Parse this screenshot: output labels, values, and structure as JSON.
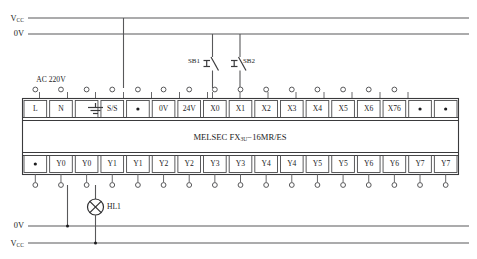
{
  "diagram": {
    "device_label": "MELSEC FX",
    "device_label_sub": "3U",
    "device_label_tail": "−16MR/ES",
    "colors": {
      "wire": "#58585a",
      "box": "#3a3a3c",
      "text": "#1c1c1e",
      "background": "#ffffff"
    }
  },
  "rails": {
    "top": [
      {
        "name": "vcc-top",
        "label": "V",
        "label_sub": "CC"
      },
      {
        "name": "zerov-top",
        "label": "0V",
        "label_sub": ""
      }
    ],
    "bottom": [
      {
        "name": "zerov-bottom",
        "label": "0V",
        "label_sub": ""
      },
      {
        "name": "vcc-bottom",
        "label": "V",
        "label_sub": "CC"
      }
    ]
  },
  "source": {
    "ac_label": "AC 220V"
  },
  "switches": [
    {
      "name": "sb1",
      "label": "SB1",
      "terminal": "X0"
    },
    {
      "name": "sb2",
      "label": "SB2",
      "terminal": "X1"
    }
  ],
  "lamp": {
    "name": "hl1",
    "label": "HL1"
  },
  "top_terminals": [
    {
      "label": "L",
      "icon": ""
    },
    {
      "label": "N",
      "icon": ""
    },
    {
      "label": "",
      "icon": "earth-ground-icon"
    },
    {
      "label": "S/S",
      "icon": ""
    },
    {
      "label": "",
      "icon": "dot-icon"
    },
    {
      "label": "0V",
      "icon": ""
    },
    {
      "label": "24V",
      "icon": ""
    },
    {
      "label": "X0",
      "icon": ""
    },
    {
      "label": "X1",
      "icon": ""
    },
    {
      "label": "X2",
      "icon": ""
    },
    {
      "label": "X3",
      "icon": ""
    },
    {
      "label": "X4",
      "icon": ""
    },
    {
      "label": "X5",
      "icon": ""
    },
    {
      "label": "X6",
      "icon": ""
    },
    {
      "label": "X76",
      "icon": ""
    },
    {
      "label": "",
      "icon": "dot-icon"
    },
    {
      "label": "",
      "icon": "dot-icon"
    }
  ],
  "bottom_terminals": [
    {
      "label": "",
      "icon": "dot-icon"
    },
    {
      "label": "Y0",
      "icon": ""
    },
    {
      "label": "Y0",
      "icon": ""
    },
    {
      "label": "Y1",
      "icon": ""
    },
    {
      "label": "Y1",
      "icon": ""
    },
    {
      "label": "Y2",
      "icon": ""
    },
    {
      "label": "Y2",
      "icon": ""
    },
    {
      "label": "Y3",
      "icon": ""
    },
    {
      "label": "Y3",
      "icon": ""
    },
    {
      "label": "Y4",
      "icon": ""
    },
    {
      "label": "Y4",
      "icon": ""
    },
    {
      "label": "Y5",
      "icon": ""
    },
    {
      "label": "Y5",
      "icon": ""
    },
    {
      "label": "Y6",
      "icon": ""
    },
    {
      "label": "Y6",
      "icon": ""
    },
    {
      "label": "Y7",
      "icon": ""
    },
    {
      "label": "Y7",
      "icon": ""
    }
  ]
}
